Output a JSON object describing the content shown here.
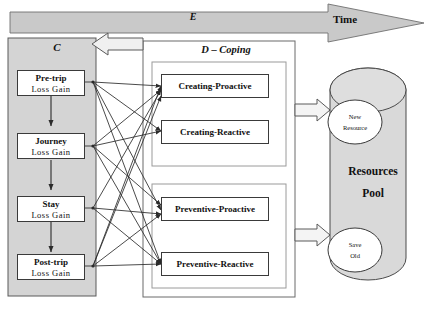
{
  "diagram": {
    "title_axis": {
      "e_label": "E",
      "time_label": "Time"
    },
    "stress_panel": {
      "label": "C",
      "stages": [
        {
          "name": "Pre-trip",
          "sub": "Loss  Gain"
        },
        {
          "name": "Journey",
          "sub": "Loss  Gain"
        },
        {
          "name": "Stay",
          "sub": "Loss  Gain"
        },
        {
          "name": "Post-trip",
          "sub": "Loss  Gain"
        }
      ]
    },
    "coping_panel": {
      "label": "D – Coping",
      "groups": [
        {
          "items": [
            {
              "name": "Creating-Proactive"
            },
            {
              "name": "Creating-Reactive"
            }
          ]
        },
        {
          "items": [
            {
              "name": "Preventive-Proactive"
            },
            {
              "name": "Preventive-Reactive"
            }
          ]
        }
      ]
    },
    "resources_pool": {
      "title_line1": "Resources",
      "title_line2": "Pool",
      "nodes": [
        {
          "line1": "New",
          "line2": "Resource"
        },
        {
          "line1": "Save",
          "line2": "Old"
        }
      ]
    },
    "colors": {
      "panel_fill": "#d4d4d4",
      "cylinder_fill": "#d9d9d9",
      "stroke": "#3a3a3a",
      "arrow_fill": "#e8e8e8",
      "background": "#ffffff"
    }
  }
}
